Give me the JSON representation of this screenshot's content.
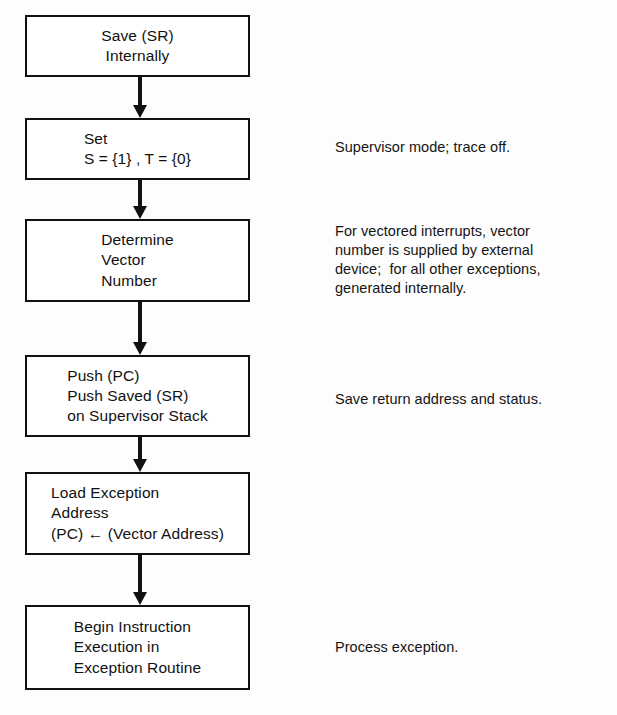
{
  "diagram": {
    "background_color": "#fdfdfd",
    "line_color": "#111111",
    "text_color": "#111111"
  },
  "nodes": [
    {
      "id": "save-sr",
      "name": "save-sr-internally-box",
      "text": "Save (SR)\nInternally",
      "align": "center",
      "x": 25,
      "y": 15,
      "width": 225,
      "height": 62
    },
    {
      "id": "set-flags",
      "name": "set-status-flags-box",
      "text": "Set\nS = {1} , T = {0}",
      "align": "left",
      "x": 25,
      "y": 118,
      "width": 225,
      "height": 62
    },
    {
      "id": "determine-vector",
      "name": "determine-vector-number-box",
      "text": "Determine\nVector\nNumber",
      "align": "left",
      "x": 25,
      "y": 219,
      "width": 225,
      "height": 83
    },
    {
      "id": "push-stack",
      "name": "push-pc-sr-box",
      "text": "Push (PC)\nPush Saved (SR)\non Supervisor Stack",
      "align": "left",
      "x": 25,
      "y": 355,
      "width": 225,
      "height": 82
    },
    {
      "id": "load-exception-address",
      "name": "load-exception-address-box",
      "text": "Load Exception\nAddress\n(PC) ← (Vector Address)",
      "align": "left",
      "x": 25,
      "y": 472,
      "width": 225,
      "height": 83
    },
    {
      "id": "begin-execution",
      "name": "begin-instruction-execution-box",
      "text": "Begin Instruction\nExecution in\nException Routine",
      "align": "left",
      "x": 25,
      "y": 605,
      "width": 225,
      "height": 85
    }
  ],
  "connectors": [
    {
      "name": "connector-save-to-set",
      "from": "save-sr",
      "to": "set-flags",
      "x": 140,
      "y": 77,
      "height": 41
    },
    {
      "name": "connector-set-to-determine",
      "from": "set-flags",
      "to": "determine-vector",
      "x": 140,
      "y": 180,
      "height": 39
    },
    {
      "name": "connector-determine-to-push",
      "from": "determine-vector",
      "to": "push-stack",
      "x": 140,
      "y": 302,
      "height": 53
    },
    {
      "name": "connector-push-to-load",
      "from": "push-stack",
      "to": "load-exception-address",
      "x": 140,
      "y": 437,
      "height": 35
    },
    {
      "name": "connector-load-to-begin",
      "from": "load-exception-address",
      "to": "begin-execution",
      "x": 140,
      "y": 555,
      "height": 50
    }
  ],
  "annotations": [
    {
      "id": "note-supervisor-mode",
      "name": "annotation-supervisor-mode",
      "for_node": "set-flags",
      "text": "Supervisor mode; trace off.",
      "x": 335,
      "y": 138
    },
    {
      "id": "note-vector-number",
      "name": "annotation-vector-number-source",
      "for_node": "determine-vector",
      "text": "For vectored interrupts, vector\nnumber is supplied by external\ndevice;  for all other exceptions,\ngenerated internally.",
      "x": 335,
      "y": 222
    },
    {
      "id": "note-save-return",
      "name": "annotation-save-return-address",
      "for_node": "push-stack",
      "text": "Save return address and status.",
      "x": 335,
      "y": 390
    },
    {
      "id": "note-process-exception",
      "name": "annotation-process-exception",
      "for_node": "begin-execution",
      "text": "Process exception.",
      "x": 335,
      "y": 638
    }
  ]
}
